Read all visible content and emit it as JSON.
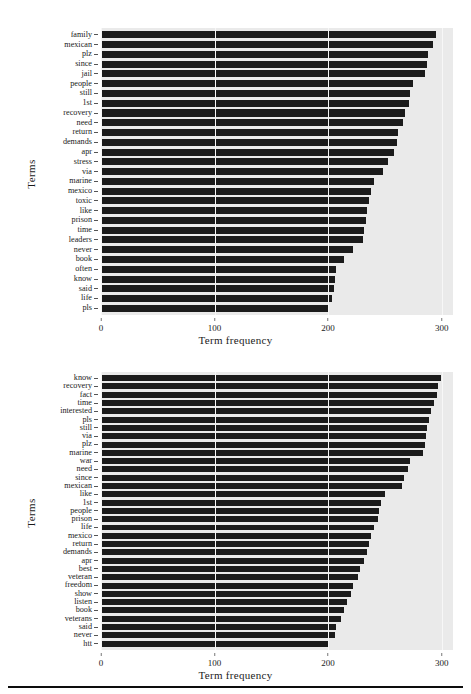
{
  "figure": {
    "background": "#ffffff",
    "plot_background": "#eaeaea",
    "bar_color": "#1b1b1b"
  },
  "footer": {
    "rule": ""
  },
  "chart_data": [
    {
      "id": "top",
      "type": "bar",
      "orientation": "horizontal",
      "title": "",
      "xlabel": "Term frequency",
      "ylabel": "Terms",
      "xlim": [
        0,
        310
      ],
      "xticks": [
        0,
        100,
        200,
        300
      ],
      "xtick_labels": [
        "0",
        "100",
        "200",
        "300"
      ],
      "grid": true,
      "legend": "none",
      "categories": [
        "family",
        "mexican",
        "plz",
        "since",
        "jail",
        "people",
        "still",
        "1st",
        "recovery",
        "need",
        "return",
        "demands",
        "apr",
        "stress",
        "via",
        "marine",
        "mexico",
        "toxic",
        "like",
        "prison",
        "time",
        "leaders",
        "never",
        "book",
        "often",
        "know",
        "said",
        "life",
        "pls"
      ],
      "values": [
        295,
        292,
        288,
        287,
        285,
        275,
        272,
        271,
        268,
        266,
        262,
        261,
        258,
        253,
        248,
        240,
        238,
        236,
        234,
        233,
        232,
        231,
        222,
        214,
        207,
        206,
        205,
        203,
        200
      ]
    },
    {
      "id": "bottom",
      "type": "bar",
      "orientation": "horizontal",
      "title": "",
      "xlabel": "Term frequency",
      "ylabel": "Terms",
      "xlim": [
        0,
        310
      ],
      "xticks": [
        0,
        100,
        200,
        300
      ],
      "xtick_labels": [
        "0",
        "100",
        "200",
        "300"
      ],
      "grid": true,
      "legend": "none",
      "categories": [
        "know",
        "recovery",
        "fact",
        "time",
        "interested",
        "pls",
        "still",
        "via",
        "plz",
        "marine",
        "war",
        "need",
        "since",
        "mexican",
        "like",
        "1st",
        "people",
        "prison",
        "life",
        "mexico",
        "return",
        "demands",
        "apr",
        "best",
        "veteran",
        "freedom",
        "show",
        "listen",
        "book",
        "veterans",
        "said",
        "never",
        "htt"
      ],
      "values": [
        299,
        297,
        296,
        293,
        291,
        289,
        287,
        286,
        285,
        284,
        272,
        270,
        267,
        265,
        250,
        247,
        245,
        244,
        240,
        238,
        236,
        234,
        232,
        228,
        226,
        222,
        220,
        217,
        214,
        211,
        207,
        206,
        201
      ]
    }
  ]
}
